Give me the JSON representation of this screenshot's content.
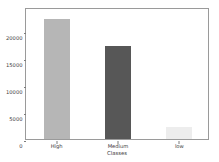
{
  "chart_data": {
    "type": "bar",
    "title": "",
    "xlabel": "Classes",
    "ylabel": "Number of instances",
    "categories": [
      "High",
      "Medium",
      "low"
    ],
    "values": [
      22200,
      17300,
      2300
    ],
    "bar_colors": [
      "#b6b6b6",
      "#575757",
      "#ededed"
    ],
    "ylim": [
      0,
      24500
    ],
    "yticks": [
      0,
      5000,
      10000,
      15000,
      20000
    ],
    "ytick_labels": [
      "0",
      "5000",
      "10000",
      "15000",
      "20000"
    ],
    "grid": false,
    "legend": null,
    "frame": true
  },
  "axes": {
    "y_axis_name": "y-axis",
    "x_axis_name": "x-axis"
  }
}
